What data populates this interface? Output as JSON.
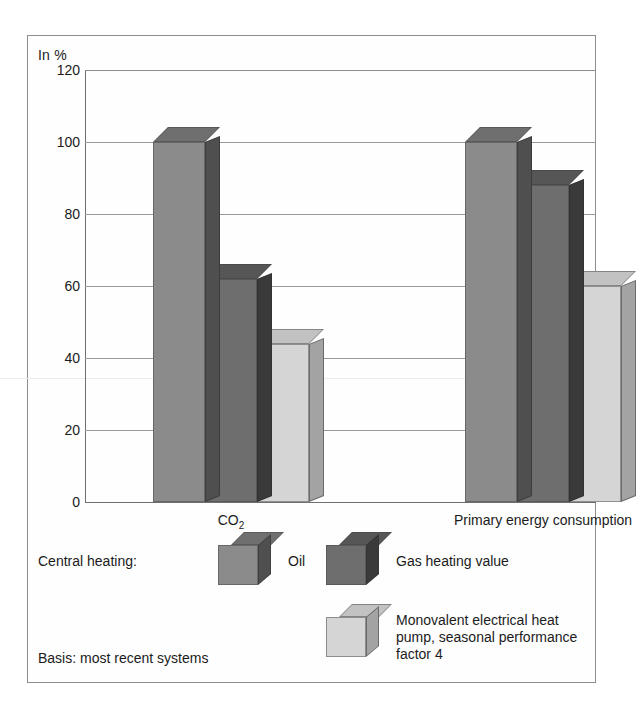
{
  "chart_data": {
    "type": "bar",
    "title": "",
    "subtitle": "",
    "unit_label": "In %",
    "xlabel": "",
    "ylabel": "In %",
    "ylim": [
      0,
      120
    ],
    "yticks": [
      0,
      20,
      40,
      60,
      80,
      100,
      120
    ],
    "ytick_labels": [
      "0",
      "20",
      "40",
      "60",
      "80",
      "100",
      "120"
    ],
    "grid": true,
    "grid_axis": "y",
    "legend_position": "below-plot",
    "categories": [
      "CO2",
      "Primary energy consumption"
    ],
    "category_labels": [
      "CO",
      "Primary energy consumption"
    ],
    "category_sub": "2",
    "series": [
      {
        "name": "Oil",
        "color": "#8b8b8b",
        "side_color": "#4f4f4f",
        "top_color": "#6f6f6f",
        "values": [
          100,
          100
        ]
      },
      {
        "name": "Gas heating value",
        "color": "#6e6e6e",
        "side_color": "#3a3a3a",
        "top_color": "#565656",
        "values": [
          62,
          88
        ]
      },
      {
        "name": "Monovalent electrical heat pump, seasonal performance factor 4",
        "color": "#d5d5d5",
        "side_color": "#a3a3a3",
        "top_color": "#c2c2c2",
        "values": [
          44,
          60
        ]
      }
    ]
  },
  "legend": {
    "prefix_label": "Central heating:",
    "oil_label": "Oil",
    "gas_label": "Gas heating value",
    "heatpump_label": "Monovalent electrical heat pump, seasonal performance factor 4",
    "basis_label": "Basis: most recent systems"
  },
  "colors": {
    "frame": "#8e8e8e",
    "gridline": "#9a9a9a",
    "axis": "#6f6f6f",
    "text": "#1b1b1b",
    "background": "#ffffff"
  }
}
